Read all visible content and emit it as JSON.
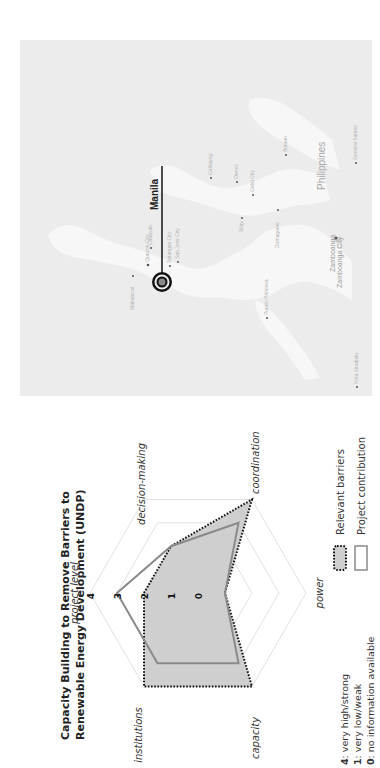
{
  "map": {
    "country_label": "Philippines",
    "capital": {
      "label": "Manila"
    },
    "cities": [
      {
        "name": "Cauayan"
      },
      {
        "name": "San Jose City"
      },
      {
        "name": "Mabalacat"
      },
      {
        "name": "Quezon City"
      },
      {
        "name": "Batangas City"
      },
      {
        "name": "Calbayog"
      },
      {
        "name": "Ormoc"
      },
      {
        "name": "Cebu City"
      },
      {
        "name": "Butuan"
      },
      {
        "name": "Silay"
      },
      {
        "name": "Dumaguete"
      },
      {
        "name": "Puerto Princesa"
      },
      {
        "name": "Zamboanga"
      },
      {
        "name": "Zamboanga City"
      },
      {
        "name": "General Santos"
      },
      {
        "name": "Kota Kinabalu"
      }
    ]
  },
  "chart_data": {
    "type": "radar",
    "title": "Capacity Building to Remove Barriers to Renewable Energy Development (UNDP)",
    "title_lines": [
      "Capacity Building to Remove Barriers to",
      "Renewable Energy Development (UNDP)"
    ],
    "categories": [
      "project level",
      "decision-making",
      "coordination",
      "power",
      "capacity",
      "institutions"
    ],
    "scale_ticks": [
      "0",
      "1",
      "2",
      "3",
      "4"
    ],
    "rlim": [
      0,
      4
    ],
    "series": [
      {
        "name": "Relevant barriers",
        "values": [
          2,
          2,
          4,
          1,
          4,
          4
        ],
        "style": "dotted-filled",
        "fill": "#cfcfcf",
        "stroke": "#111111"
      },
      {
        "name": "Project contribution",
        "values": [
          3,
          2,
          3,
          1,
          3,
          3
        ],
        "style": "solid-outline",
        "fill": "none",
        "stroke": "#8a8a8a"
      }
    ],
    "scale_legend": [
      {
        "num": "4",
        "text": ": very high/strong"
      },
      {
        "num": "1",
        "text": ": very low/weak"
      },
      {
        "num": "0",
        "text": ": no information available"
      }
    ],
    "legend_position": "bottom-right",
    "rotation_deg": -90
  }
}
